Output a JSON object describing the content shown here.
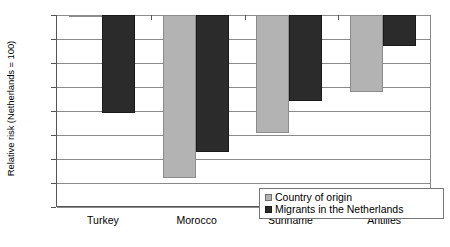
{
  "chart_data": {
    "type": "bar",
    "title": "",
    "xlabel": "",
    "ylabel": "Relative risk (Netherlands = 100)",
    "ylim": [
      20,
      100
    ],
    "ytick_step": 10,
    "yticks": [
      100,
      90,
      80,
      70,
      60,
      50,
      40,
      30,
      20
    ],
    "grid": true,
    "bar_origin": "top",
    "baseline_value": 100,
    "legend_position": "bottom-right",
    "categories": [
      "Turkey",
      "Morocco",
      "Suriname",
      "Antilles"
    ],
    "series": [
      {
        "name": "Country of origin",
        "color": "#b3b3b3",
        "values": [
          100,
          32,
          51,
          68
        ]
      },
      {
        "name": "Migrants in the Netherlands",
        "color": "#2b2b2b",
        "values": [
          59,
          43,
          64,
          87
        ]
      }
    ]
  },
  "legend": {
    "items": [
      {
        "label": "Country of origin",
        "swatch": "origin"
      },
      {
        "label": "Migrants in the Netherlands",
        "swatch": "migrant"
      }
    ]
  },
  "axis": {
    "y_title": "Relative risk (Netherlands = 100)"
  }
}
